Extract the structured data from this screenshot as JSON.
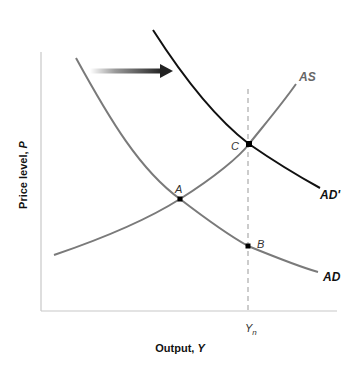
{
  "diagram": {
    "type": "AS-AD shift",
    "axes": {
      "x_label": "Output, ",
      "x_label_var": "Y",
      "y_label": "Price level, ",
      "y_label_var": "P",
      "x_tick_label": "Y",
      "x_tick_sub": "n"
    },
    "curves": [
      {
        "name": "AS",
        "label": "AS",
        "color": "#7a7a7a"
      },
      {
        "name": "AD",
        "label": "AD",
        "color": "#7a7a7a"
      },
      {
        "name": "AD'",
        "label": "AD'",
        "color": "#111111"
      }
    ],
    "points": [
      {
        "name": "A",
        "label": "A"
      },
      {
        "name": "B",
        "label": "B"
      },
      {
        "name": "C",
        "label": "C"
      }
    ],
    "shift_arrow": {
      "direction": "right",
      "meaning": "AD shifts right to AD'"
    },
    "colors": {
      "axis": "#c8c8c8",
      "dashed": "#c0c0c0",
      "curve_gray": "#7a7a7a",
      "curve_black": "#111111",
      "arrow": "#222222"
    }
  }
}
